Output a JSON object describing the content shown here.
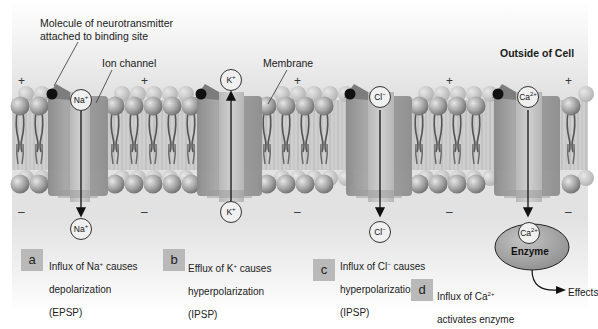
{
  "figure": {
    "region_label": "Outside of Cell",
    "callouts": {
      "neurotransmitter_line1": "Molecule of neurotransmitter",
      "neurotransmitter_line2": "attached to binding site",
      "ion_channel": "Ion channel",
      "membrane": "Membrane"
    },
    "charges": {
      "outside": "+",
      "inside": "–"
    },
    "ions": {
      "a_top": {
        "base": "Na",
        "sup": "+"
      },
      "a_bottom": {
        "base": "Na",
        "sup": "+"
      },
      "b_top": {
        "base": "K",
        "sup": "+"
      },
      "b_bottom": {
        "base": "K",
        "sup": "+"
      },
      "c_top": {
        "base": "Cl",
        "sup": "−"
      },
      "c_bottom": {
        "base": "Cl",
        "sup": "−"
      },
      "d_top": {
        "base": "Ca",
        "sup": "2+"
      },
      "d_bottom": {
        "base": "Ca",
        "sup": "2+"
      }
    },
    "enzyme": {
      "label": "Enzyme",
      "effects": "Effects"
    },
    "panels": [
      {
        "letter": "a",
        "line1": "Influx of Na",
        "sup": "+",
        "line1_end": " causes",
        "line2": "depolarization",
        "line3": "(EPSP)"
      },
      {
        "letter": "b",
        "line1": "Efflux of K",
        "sup": "+",
        "line1_end": " causes",
        "line2": "hyperpolarization",
        "line3": "(IPSP)"
      },
      {
        "letter": "c",
        "line1": "Influx of Cl",
        "sup": "−",
        "line1_end": " causes",
        "line2": "hyperpolarization",
        "line3": "(IPSP)"
      },
      {
        "letter": "d",
        "line1": "Influx of Ca",
        "sup": "2+",
        "line1_end": "",
        "line2": "activates enzyme",
        "line3": ""
      }
    ],
    "colors": {
      "panel_gray": "#d9d9d9",
      "channel_dark": "#8f8f8f",
      "channel_light": "#bdbdbd",
      "lipid_head": "#9a9a9a",
      "badge": "#b9b9b9",
      "enzyme_fill": "#a8a8a8"
    }
  }
}
